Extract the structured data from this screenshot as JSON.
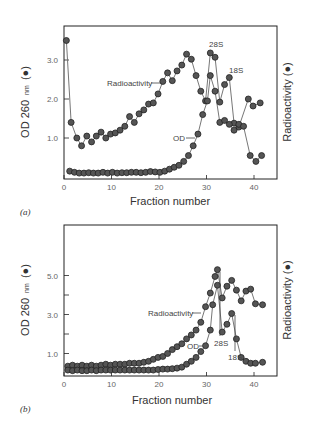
{
  "chart_data": [
    {
      "type": "line",
      "panel_label": "(a)",
      "title": "",
      "xlabel": "Fraction number",
      "ylabel": "OD 260 nm (●)",
      "ylabel_main": "OD 260",
      "ylabel_sub": "nm",
      "ylabel_marker": "(●)",
      "y2label": "Radioactivity (●)",
      "xlim": [
        0,
        45
      ],
      "ylim": [
        0,
        3.8
      ],
      "xticks": [
        "0",
        "10",
        "20",
        "30",
        "40"
      ],
      "yticks": [
        "1.0",
        "2.0",
        "3.0"
      ],
      "grid": false,
      "annotations": [
        "Radioactivity",
        "OD",
        "28S",
        "18S"
      ],
      "series": [
        {
          "name": "Radioactivity",
          "x": [
            0.5,
            1.5,
            2.7,
            3.7,
            4.8,
            5.8,
            6.8,
            7.8,
            8.8,
            9.8,
            10.8,
            11.8,
            12.8,
            13.8,
            14.8,
            15.8,
            16.8,
            17.8,
            18.8,
            19.8,
            20.8,
            21.8,
            22.8,
            23.8,
            24.8,
            25.8,
            26.8,
            27.8,
            28.8,
            29.8,
            30.8,
            31.8,
            32.8,
            33.8,
            34.8,
            35.8,
            36.8,
            38.8,
            39.8,
            41.3
          ],
          "values": [
            3.5,
            1.4,
            1.0,
            0.8,
            1.05,
            0.9,
            1.05,
            1.15,
            1.0,
            1.1,
            1.13,
            1.2,
            1.3,
            1.55,
            1.4,
            1.62,
            1.72,
            1.87,
            1.9,
            2.13,
            2.45,
            2.67,
            2.47,
            2.72,
            2.87,
            3.15,
            3.02,
            2.6,
            2.2,
            1.95,
            3.18,
            3.07,
            1.92,
            2.37,
            2.55,
            1.38,
            1.28,
            2.0,
            1.82,
            1.9
          ]
        },
        {
          "name": "OD",
          "x": [
            1.2,
            2.2,
            3.2,
            4.2,
            5.2,
            6.2,
            7.2,
            8.2,
            9.2,
            10.2,
            11.2,
            12.2,
            13.2,
            14.2,
            15.2,
            16.2,
            17.2,
            18.2,
            19.2,
            20.2,
            21.2,
            22.2,
            23.2,
            24.2,
            25.2,
            26.2,
            27.2,
            28.2,
            29.2,
            30.2,
            30.8,
            31.8,
            32.8,
            33.8,
            34.8,
            35.8,
            36.8,
            37.8,
            39.2,
            40.4,
            41.6
          ],
          "values": [
            0.15,
            0.12,
            0.1,
            0.1,
            0.11,
            0.1,
            0.1,
            0.12,
            0.1,
            0.12,
            0.1,
            0.11,
            0.11,
            0.12,
            0.12,
            0.11,
            0.12,
            0.14,
            0.13,
            0.12,
            0.15,
            0.2,
            0.25,
            0.3,
            0.4,
            0.55,
            0.8,
            1.1,
            1.6,
            1.95,
            2.6,
            2.2,
            1.4,
            1.45,
            1.35,
            1.2,
            1.35,
            1.3,
            0.55,
            0.4,
            0.55
          ]
        }
      ]
    },
    {
      "type": "line",
      "panel_label": "(b)",
      "title": "",
      "xlabel": "Fraction number",
      "ylabel": "OD 260 nm (●)",
      "ylabel_main": "OD 260",
      "ylabel_sub": "nm",
      "ylabel_marker": "(●)",
      "y2label": "Radioactivity (●)",
      "xlim": [
        0,
        45
      ],
      "ylim": [
        0,
        7.6
      ],
      "xticks": [
        "0",
        "10",
        "20",
        "30",
        "40"
      ],
      "yticks": [
        "1.0",
        "3.0",
        "5.0"
      ],
      "grid": false,
      "annotations": [
        "Radioactivity",
        "OD",
        "28S",
        "18S"
      ],
      "series": [
        {
          "name": "Radioactivity",
          "x": [
            0.8,
            1.8,
            2.8,
            3.8,
            4.8,
            5.8,
            6.8,
            7.8,
            8.8,
            9.8,
            10.8,
            11.8,
            12.8,
            13.8,
            14.8,
            15.8,
            16.8,
            17.8,
            18.8,
            19.8,
            20.8,
            21.8,
            22.8,
            23.8,
            24.8,
            25.8,
            26.8,
            27.8,
            28.8,
            29.8,
            30.8,
            31.8,
            32.3,
            33.3,
            34.3,
            35.3,
            36.3,
            37.3,
            38.3,
            39.3,
            40.3,
            41.8
          ],
          "values": [
            0.35,
            0.4,
            0.35,
            0.4,
            0.35,
            0.4,
            0.35,
            0.4,
            0.45,
            0.4,
            0.45,
            0.45,
            0.45,
            0.5,
            0.5,
            0.5,
            0.55,
            0.6,
            0.7,
            0.8,
            0.85,
            1.0,
            1.2,
            1.35,
            1.5,
            1.75,
            1.95,
            2.2,
            2.6,
            3.4,
            4.1,
            4.95,
            5.3,
            3.85,
            4.45,
            4.75,
            4.25,
            3.7,
            4.2,
            4.3,
            3.55,
            3.5
          ]
        },
        {
          "name": "OD",
          "x": [
            0.8,
            1.8,
            2.8,
            3.8,
            4.8,
            5.8,
            6.8,
            7.8,
            8.8,
            9.8,
            10.8,
            11.8,
            12.8,
            13.8,
            14.8,
            15.8,
            16.8,
            17.8,
            18.8,
            19.8,
            20.8,
            21.8,
            22.8,
            23.8,
            24.8,
            25.8,
            26.8,
            27.8,
            28.8,
            29.8,
            30.8,
            31.3,
            32.3,
            33.3,
            34.3,
            35.3,
            36.3,
            37.3,
            38.3,
            39.3,
            40.3,
            41.8
          ],
          "values": [
            0.15,
            0.12,
            0.15,
            0.12,
            0.12,
            0.15,
            0.12,
            0.15,
            0.15,
            0.15,
            0.15,
            0.15,
            0.15,
            0.15,
            0.15,
            0.15,
            0.15,
            0.15,
            0.15,
            0.18,
            0.2,
            0.2,
            0.22,
            0.25,
            0.3,
            0.45,
            0.6,
            0.8,
            1.1,
            1.4,
            2.2,
            3.5,
            4.5,
            2.1,
            2.5,
            3.05,
            1.75,
            0.8,
            0.6,
            0.5,
            0.5,
            0.55
          ]
        }
      ]
    }
  ]
}
